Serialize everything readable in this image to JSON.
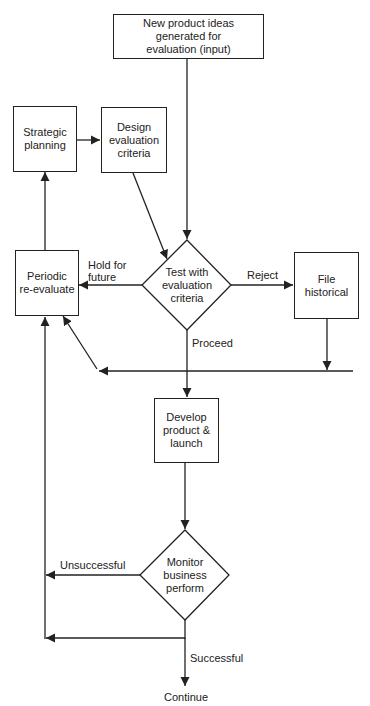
{
  "diagram": {
    "nodes": {
      "input": {
        "type": "process",
        "text": "New product ideas\ngenerated for\nevaluation (input)"
      },
      "strategic": {
        "type": "process",
        "text": "Strategic\nplanning"
      },
      "design": {
        "type": "process",
        "text": "Design\nevaluation\ncriteria"
      },
      "test": {
        "type": "decision",
        "text": "Test with\nevaluation\ncriteria"
      },
      "periodic": {
        "type": "process",
        "text": "Periodic\nre-evaluate"
      },
      "file": {
        "type": "process",
        "text": "File\nhistorical"
      },
      "develop": {
        "type": "process",
        "text": "Develop\nproduct &\nlaunch"
      },
      "monitor": {
        "type": "decision",
        "text": "Monitor\nbusiness\nperform"
      },
      "continue": {
        "type": "terminal-text",
        "text": "Continue"
      }
    },
    "edge_labels": {
      "hold": "Hold for\nfuture",
      "reject": "Reject",
      "proceed": "Proceed",
      "unsuccessful": "Unsuccessful",
      "successful": "Successful"
    },
    "edges": [
      {
        "from": "input",
        "to": "test"
      },
      {
        "from": "strategic",
        "to": "design"
      },
      {
        "from": "design",
        "to": "test"
      },
      {
        "from": "test",
        "to": "periodic",
        "label": "Hold for future"
      },
      {
        "from": "test",
        "to": "file",
        "label": "Reject"
      },
      {
        "from": "test",
        "to": "develop",
        "label": "Proceed"
      },
      {
        "from": "file",
        "to": "periodic"
      },
      {
        "from": "periodic",
        "to": "strategic"
      },
      {
        "from": "develop",
        "to": "monitor"
      },
      {
        "from": "monitor",
        "to": "periodic",
        "label": "Unsuccessful"
      },
      {
        "from": "monitor",
        "to": "continue",
        "label": "Successful"
      }
    ],
    "colors": {
      "stroke": "#222222",
      "fill": "#ffffff",
      "text": "#222222"
    }
  }
}
